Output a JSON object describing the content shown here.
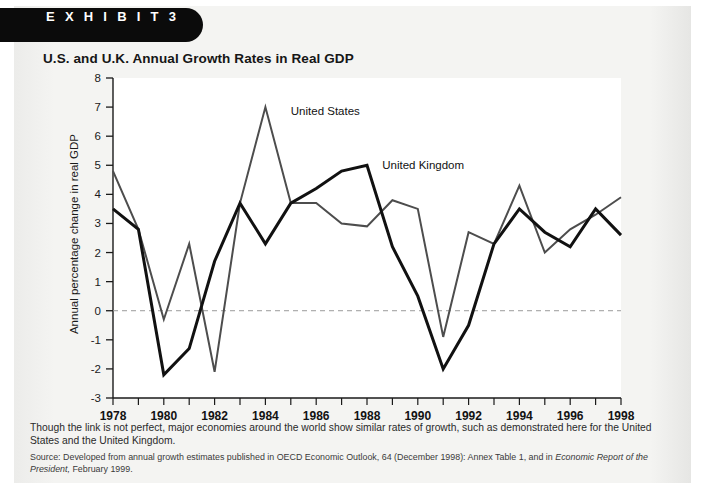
{
  "exhibit": {
    "label": "E X H I B I T   3"
  },
  "chart_title": "U.S. and U.K. Annual Growth Rates in Real GDP",
  "caption": "Though the link is not perfect, major economies around the world show similar rates of growth, such as demonstrated here for the United States and the United Kingdom.",
  "source": {
    "prefix": "Source: Developed from annual growth estimates published in OECD Economic Outlook, 64 (December 1998): Annex Table 1, and in ",
    "italic1": "Economic Report of the President,",
    "suffix": " February 1999."
  },
  "colors": {
    "us_line": "#4d4d4d",
    "uk_line": "#111111",
    "zero_line": "#9a9a9a",
    "axis": "#1a1a1a",
    "plot_bg": "#ffffff",
    "panel_bg": "#f2f2f0",
    "banner_bg": "#0b0b0b"
  },
  "chart_data": {
    "type": "line",
    "title": "U.S. and U.K. Annual Growth Rates in Real GDP",
    "xlabel": "",
    "ylabel": "Annual percentage change in real GDP",
    "ylim": [
      -3,
      8
    ],
    "xlim": [
      1978,
      1998
    ],
    "yticks": [
      8,
      7,
      6,
      5,
      4,
      3,
      2,
      1,
      0,
      -1,
      -2,
      -3
    ],
    "ytick_labels": [
      "8",
      "7",
      "6",
      "5",
      "4",
      "3",
      "2",
      "1",
      "0",
      "-1",
      "-2",
      "-3"
    ],
    "xticks": [
      1978,
      1979,
      1980,
      1981,
      1982,
      1983,
      1984,
      1985,
      1986,
      1987,
      1988,
      1989,
      1990,
      1991,
      1992,
      1993,
      1994,
      1995,
      1996,
      1997,
      1998
    ],
    "xtick_labels_shown": [
      "1978",
      "1980",
      "1982",
      "1984",
      "1986",
      "1988",
      "1990",
      "1992",
      "1994",
      "1996",
      "1998"
    ],
    "grid": false,
    "zero_reference_line": 0,
    "legend_position": "inline-annotations",
    "x": [
      1978,
      1979,
      1980,
      1981,
      1982,
      1983,
      1984,
      1985,
      1986,
      1987,
      1988,
      1989,
      1990,
      1991,
      1992,
      1993,
      1994,
      1995,
      1996,
      1997,
      1998
    ],
    "series": [
      {
        "name": "United States",
        "label": "United States",
        "label_x": 1985.0,
        "label_y": 6.85,
        "color": "#4d4d4d",
        "width": 2,
        "values": [
          4.8,
          2.8,
          -0.3,
          2.3,
          -2.1,
          3.7,
          7.0,
          3.7,
          3.7,
          3.0,
          2.9,
          3.8,
          3.5,
          -0.9,
          2.7,
          2.3,
          4.3,
          2.0,
          2.8,
          3.3,
          3.9
        ]
      },
      {
        "name": "United Kingdom",
        "label": "United Kingdom",
        "label_x": 1988.6,
        "label_y": 5.0,
        "color": "#111111",
        "width": 3,
        "values": [
          3.5,
          2.8,
          -2.2,
          -1.3,
          1.7,
          3.7,
          2.3,
          3.7,
          4.2,
          4.8,
          5.0,
          2.2,
          0.5,
          -2.0,
          -0.5,
          2.3,
          3.5,
          2.7,
          2.2,
          3.5,
          2.6
        ]
      }
    ]
  }
}
